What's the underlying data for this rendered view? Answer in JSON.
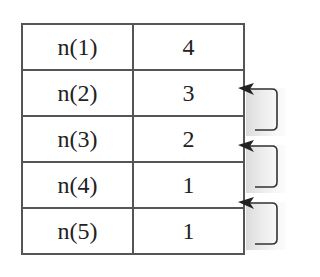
{
  "diagram": {
    "type": "lookup-table-with-back-references",
    "rows": [
      {
        "label": "n(1)",
        "value": "4"
      },
      {
        "label": "n(2)",
        "value": "3"
      },
      {
        "label": "n(3)",
        "value": "2"
      },
      {
        "label": "n(4)",
        "value": "1"
      },
      {
        "label": "n(5)",
        "value": "1"
      }
    ],
    "arrows": [
      {
        "from_row": "n(3)",
        "to_row": "n(2)"
      },
      {
        "from_row": "n(4)",
        "to_row": "n(3)"
      },
      {
        "from_row": "n(5)",
        "to_row": "n(4)"
      }
    ],
    "colors": {
      "border": "#555555",
      "text": "#222222",
      "arrow": "#333333",
      "shadow": "#cccccc"
    }
  }
}
